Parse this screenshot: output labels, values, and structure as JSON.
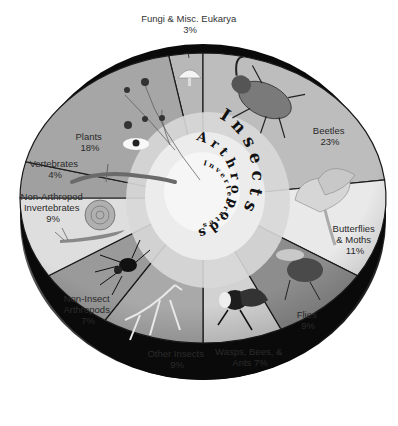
{
  "chart_data": {
    "type": "pie",
    "title": "",
    "style": "3D grayscale pie with illustrations",
    "categories": [
      "Fungi & Misc. Eukarya",
      "Beetles",
      "Butterflies & Moths",
      "Flies",
      "Wasps, Bees, & Ants",
      "Other Insects",
      "Non-Insect Arthropods",
      "Non-Arthropod Invertebrates",
      "Vertebrates",
      "Plants"
    ],
    "values": [
      3,
      23,
      11,
      9,
      7,
      9,
      7,
      9,
      4,
      18
    ],
    "units": "%",
    "slices": [
      {
        "label": "Fungi & Misc. Eukarya",
        "value": 3,
        "label_text": "3%",
        "fill": "#b8b8b8",
        "illustration": "mushroom"
      },
      {
        "label": "Beetles",
        "value": 23,
        "label_text": "23%",
        "fill": "#bdbdbd",
        "illustration": "rhinoceros-beetle"
      },
      {
        "label": "Butterflies & Moths",
        "value": 11,
        "label_text": "11%",
        "fill": "#e9e9e9",
        "illustration": "luna-moth"
      },
      {
        "label": "Flies",
        "value": 9,
        "label_text": "9%",
        "fill": "#8d8d8d",
        "illustration": "fly"
      },
      {
        "label": "Wasps, Bees, & Ants",
        "value": 7,
        "label_text": "Ants 7%",
        "fill": "#d2d2d2",
        "illustration": "bee"
      },
      {
        "label": "Other Insects",
        "value": 9,
        "label_text": "9%",
        "fill": "#a9a9a9",
        "illustration": "praying-mantis"
      },
      {
        "label": "Non-Insect Arthropods",
        "value": 7,
        "label_text": "7%",
        "fill": "#9a9a9a",
        "illustration": "spider"
      },
      {
        "label": "Non-Arthropod Invertebrates",
        "value": 9,
        "label_text": "9%",
        "fill": "#dedede",
        "illustration": "snail"
      },
      {
        "label": "Vertebrates",
        "value": 4,
        "label_text": "4%",
        "fill": "#a0a0a0",
        "illustration": "salamander"
      },
      {
        "label": "Plants",
        "value": 18,
        "label_text": "18%",
        "fill": "#a6a6a6",
        "illustration": "flowering-plant"
      }
    ],
    "center_spiral": {
      "outer": "Insects",
      "middle": "Arthropods",
      "inner": "Invertebrates"
    },
    "legend": "none (labels on slices)"
  },
  "labels": {
    "fungi": {
      "line1": "Fungi & Misc. Eukarya",
      "line2": "3%"
    },
    "beetles": {
      "line1": "Beetles",
      "line2": "23%"
    },
    "butterflies": {
      "line1": "Butterflies",
      "line2": "& Moths",
      "line3": "11%"
    },
    "flies": {
      "line1": "Flies",
      "line2": "9%"
    },
    "wasps": {
      "line1": "Wasps, Bees, &",
      "line2": "Ants 7%"
    },
    "other_insects": {
      "line1": "Other Insects",
      "line2": "9%"
    },
    "non_insect": {
      "line1": "Non-Insect",
      "line2": "Arthropods",
      "line3": "7%"
    },
    "non_arthropod": {
      "line1": "Non-Arthropod",
      "line2": "Invertebrates",
      "line3": "9%"
    },
    "vertebrates": {
      "line1": "Vertebrates",
      "line2": "4%"
    },
    "plants": {
      "line1": "Plants",
      "line2": "18%"
    }
  },
  "spiral_text": {
    "outer": "I n s e c t s",
    "middle": "A r t h r o p o d s",
    "inner": "I n v e r t e b r a t e s"
  }
}
